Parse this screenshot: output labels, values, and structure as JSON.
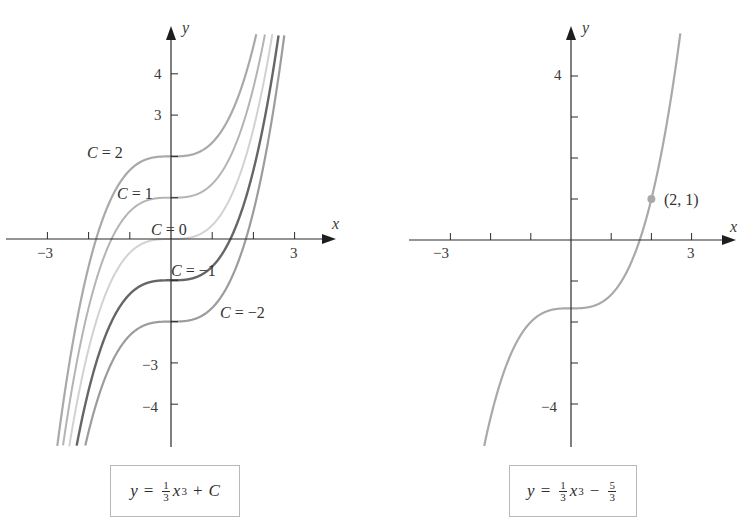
{
  "chart_data": [
    {
      "type": "line",
      "title": "y = (1/3)x^3 + C",
      "xlabel": "x",
      "ylabel": "y",
      "xlim": [
        -4.0,
        4.3
      ],
      "ylim": [
        -5.0,
        5.2
      ],
      "grid": false,
      "x_ticks": [
        -3,
        -2,
        -1,
        1,
        2,
        3
      ],
      "x_tick_labels": {
        "-3": "−3",
        "3": "3"
      },
      "y_ticks": [
        -4,
        -3,
        -2,
        -1,
        1,
        2,
        3,
        4
      ],
      "y_tick_labels": {
        "4": "4",
        "3": "3",
        "-3": "−3",
        "-4": "−4"
      },
      "function": "x^3/3 + C",
      "series": [
        {
          "name": "C = 2",
          "C": 2,
          "color": "#a9a9a9",
          "width": 2.2
        },
        {
          "name": "C = 1",
          "C": 1,
          "color": "#b4b4b4",
          "width": 2.0
        },
        {
          "name": "C = 0",
          "C": 0,
          "color": "#d2d2d2",
          "width": 2.0
        },
        {
          "name": "C = −1",
          "C": -1,
          "color": "#666666",
          "width": 2.4
        },
        {
          "name": "C = −2",
          "C": -2,
          "color": "#9c9c9c",
          "width": 2.2
        }
      ],
      "annotations": [
        {
          "text_var": "C",
          "text_rest": " = 2",
          "x": 87,
          "y": 158
        },
        {
          "text_var": "C",
          "text_rest": " = 1",
          "x": 117,
          "y": 199
        },
        {
          "text_var": "C",
          "text_rest": " = 0",
          "x": 151,
          "y": 235
        },
        {
          "text_var": "C",
          "text_rest": " = −1",
          "x": 171,
          "y": 276
        },
        {
          "text_var": "C",
          "text_rest": " = −2",
          "x": 220,
          "y": 318
        }
      ]
    },
    {
      "type": "line",
      "title": "y = (1/3)x^3 − 5/3",
      "xlabel": "x",
      "ylabel": "y",
      "xlim": [
        -4.0,
        4.2
      ],
      "ylim": [
        -5.0,
        5.2
      ],
      "grid": false,
      "x_ticks": [
        -3,
        -2,
        -1,
        1,
        2,
        3
      ],
      "x_tick_labels": {
        "-3": "−3",
        "3": "3"
      },
      "y_ticks": [
        -4,
        -3,
        -2,
        -1,
        1,
        2,
        3,
        4
      ],
      "y_tick_labels": {
        "4": "4",
        "-4": "−4"
      },
      "function": "x^3/3 - 5/3",
      "series": [
        {
          "name": "y = x^3/3 − 5/3",
          "C": -1.6667,
          "color": "#a9a9a9",
          "width": 2.2
        }
      ],
      "points": [
        {
          "x": 2,
          "y": 1,
          "label": "(2, 1)",
          "color": "#a9a9a9"
        }
      ]
    }
  ],
  "left_panel": {
    "x_axis_label": "x",
    "y_axis_label": "y",
    "tick_labels": {
      "x_neg3": "−3",
      "x_pos3": "3",
      "y_4": "4",
      "y_3": "3",
      "y_neg3": "−3",
      "y_neg4": "−4"
    },
    "formula": {
      "lhs": "y",
      "eq": "=",
      "frac_num": "1",
      "frac_den": "3",
      "var": "x",
      "exp": "3",
      "op": "+",
      "rhs": "C"
    }
  },
  "right_panel": {
    "x_axis_label": "x",
    "y_axis_label": "y",
    "tick_labels": {
      "x_neg3": "−3",
      "x_pos3": "3",
      "y_4": "4",
      "y_neg4": "−4"
    },
    "point_label": "(2, 1)",
    "formula": {
      "lhs": "y",
      "eq": "=",
      "frac_num": "1",
      "frac_den": "3",
      "var": "x",
      "exp": "3",
      "op": "−",
      "frac2_num": "5",
      "frac2_den": "3"
    }
  }
}
